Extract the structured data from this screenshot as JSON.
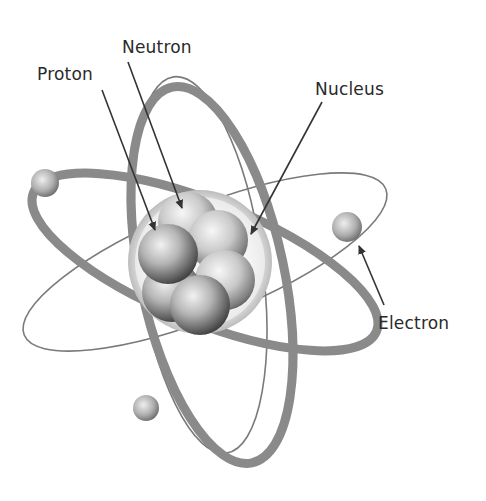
{
  "diagram": {
    "labels": {
      "proton": "Proton",
      "neutron": "Neutron",
      "nucleus": "Nucleus",
      "electron": "Electron"
    },
    "parts": {
      "nucleus": {
        "particles": 6
      },
      "electrons": 3,
      "orbits": 4
    },
    "colors": {
      "background": "#ffffff",
      "orbit_thick": "#8a8a8a",
      "orbit_thin": "#7a7a7a",
      "arrow": "#333333",
      "text": "#2a2a2a"
    }
  }
}
